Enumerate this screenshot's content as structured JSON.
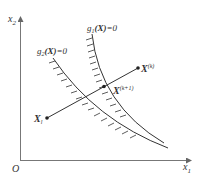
{
  "diagram": {
    "axes": {
      "y_label": "x",
      "y_label_sub": "2",
      "x_label": "x",
      "x_label_sub": "1",
      "origin_label": "O"
    },
    "constraints": [
      {
        "name": "g1",
        "label_prefix": "g",
        "label_sub": "1",
        "label_arg": "(X)",
        "label_suffix": "=0"
      },
      {
        "name": "g2",
        "label_prefix": "g",
        "label_sub": "2",
        "label_arg": "(X)",
        "label_suffix": "=0"
      }
    ],
    "points": {
      "xl": {
        "label": "X",
        "sub": "l"
      },
      "xk": {
        "label": "X",
        "sup": "(k)"
      },
      "xk1": {
        "label": "X",
        "sup": "(k+1)"
      }
    },
    "colors": {
      "line": "#333333",
      "axis": "#777777",
      "text": "#333333"
    }
  }
}
